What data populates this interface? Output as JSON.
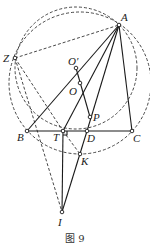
{
  "figure": {
    "caption": "图 9",
    "points": {
      "A": {
        "label": "A",
        "x": 119,
        "y": 25
      },
      "Z": {
        "label": "Z",
        "x": 15,
        "y": 58
      },
      "O_prime": {
        "label": "O′",
        "x": 76,
        "y": 68
      },
      "O": {
        "label": "O",
        "x": 80,
        "y": 83
      },
      "P": {
        "label": "P",
        "x": 90,
        "y": 117
      },
      "B": {
        "label": "B",
        "x": 27,
        "y": 131
      },
      "T": {
        "label": "T",
        "x": 63,
        "y": 131
      },
      "D": {
        "label": "D",
        "x": 87,
        "y": 131
      },
      "C": {
        "label": "C",
        "x": 132,
        "y": 131
      },
      "K": {
        "label": "K",
        "x": 80,
        "y": 154
      },
      "I": {
        "label": "I",
        "x": 62,
        "y": 212
      }
    },
    "circles": [
      {
        "name": "circumcircle",
        "center": "O",
        "r": 71,
        "style": "dashed"
      },
      {
        "name": "circle-O-prime",
        "center": "O_prime",
        "r": 61,
        "style": "dashed"
      }
    ],
    "solid_segments": [
      "AB",
      "AT",
      "AP",
      "AC",
      "BC",
      "O'P",
      "PD",
      "DI",
      "TI"
    ],
    "dashed_segments": [
      "ZA",
      "ZT",
      "ZI",
      "TK"
    ]
  }
}
